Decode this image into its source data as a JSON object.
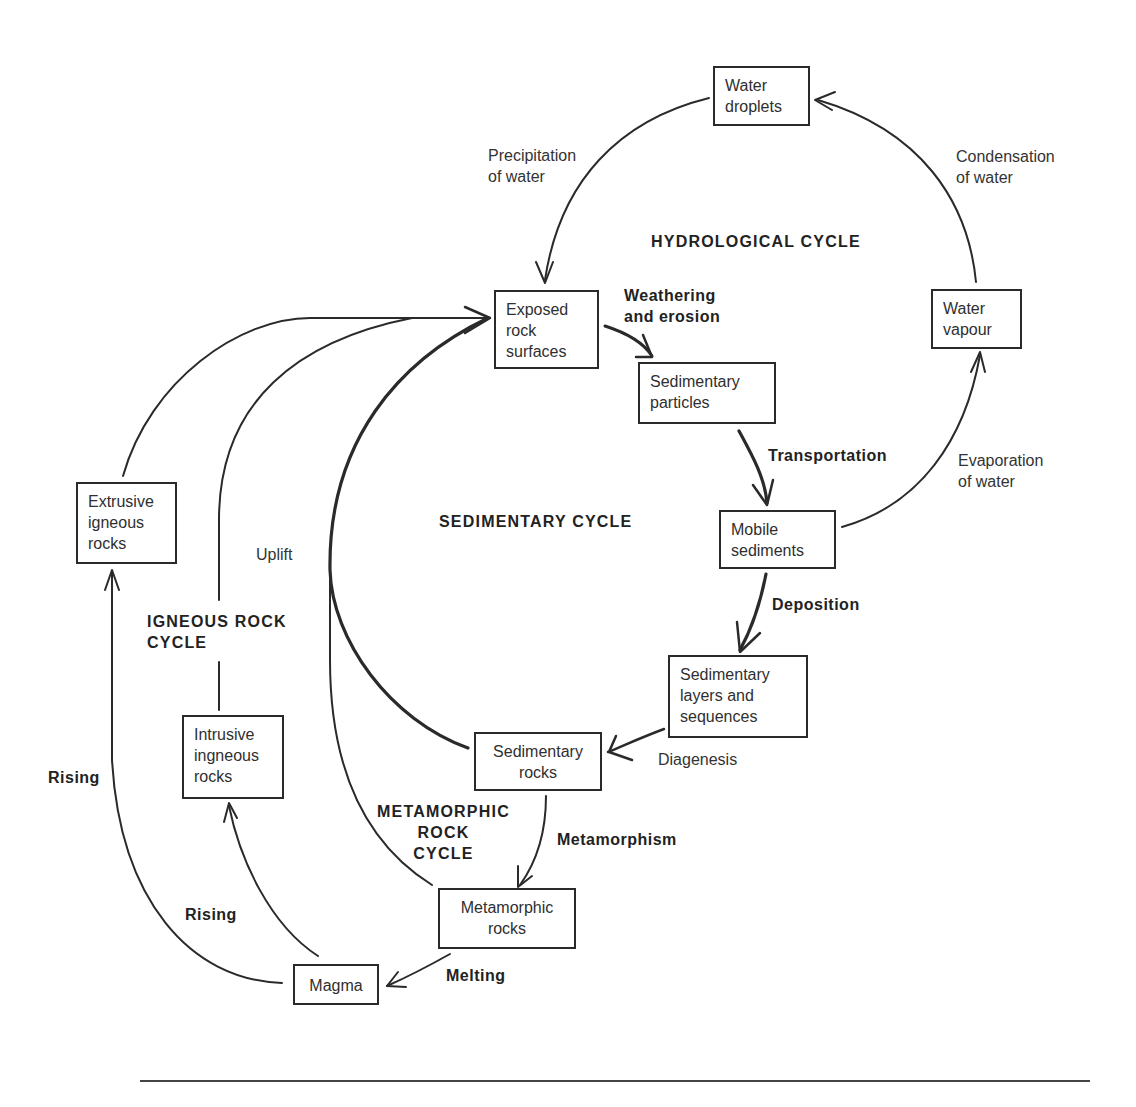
{
  "diagram": {
    "colors": {
      "line": "#2a2a2a",
      "box_border": "#2a2a2a",
      "text": "#2f2f2f"
    },
    "cycles": {
      "hydrological": "HYDROLOGICAL  CYCLE",
      "sedimentary": "SEDIMENTARY  CYCLE",
      "igneous": "IGNEOUS  ROCK\nCYCLE",
      "metamorphic": "METAMORPHIC\nROCK\nCYCLE"
    },
    "nodes": {
      "water_droplets": "Water\ndroplets",
      "water_vapour": "Water\nvapour",
      "exposed_rock": "Exposed\nrock\nsurfaces",
      "sedimentary_particles": "Sedimentary\nparticles",
      "mobile_sediments": "Mobile\nsediments",
      "sedimentary_layers": "Sedimentary\nlayers and\nsequences",
      "sedimentary_rocks": "Sedimentary\nrocks",
      "metamorphic_rocks": "Metamorphic\nrocks",
      "magma": "Magma",
      "extrusive_igneous": "Extrusive\nigneous\nrocks",
      "intrusive_igneous": "Intrusive\ningneous\nrocks"
    },
    "processes": {
      "precipitation": "Precipitation\nof water",
      "condensation": "Condensation\nof water",
      "evaporation": "Evaporation\nof water",
      "weathering": "Weathering\nand erosion",
      "transportation": "Transportation",
      "deposition": "Deposition",
      "diagenesis": "Diagenesis",
      "metamorphism": "Metamorphism",
      "melting": "Melting",
      "rising_outer": "Rising",
      "rising_inner": "Rising",
      "uplift": "Uplift"
    },
    "edges": [
      {
        "from": "water_droplets",
        "to": "exposed_rock",
        "label": "Precipitation of water"
      },
      {
        "from": "water_vapour",
        "to": "water_droplets",
        "label": "Condensation of water"
      },
      {
        "from": "mobile_sediments",
        "to": "water_vapour",
        "label": "Evaporation of water"
      },
      {
        "from": "exposed_rock",
        "to": "sedimentary_particles",
        "label": "Weathering and erosion"
      },
      {
        "from": "sedimentary_particles",
        "to": "mobile_sediments",
        "label": "Transportation"
      },
      {
        "from": "mobile_sediments",
        "to": "sedimentary_layers",
        "label": "Deposition"
      },
      {
        "from": "sedimentary_layers",
        "to": "sedimentary_rocks",
        "label": "Diagenesis"
      },
      {
        "from": "sedimentary_rocks",
        "to": "metamorphic_rocks",
        "label": "Metamorphism"
      },
      {
        "from": "metamorphic_rocks",
        "to": "magma",
        "label": "Melting"
      },
      {
        "from": "magma",
        "to": "extrusive_igneous",
        "label": "Rising"
      },
      {
        "from": "magma",
        "to": "intrusive_igneous",
        "label": "Rising"
      },
      {
        "from": "extrusive_igneous",
        "to": "exposed_rock",
        "label": ""
      },
      {
        "from": "intrusive_igneous",
        "to": "exposed_rock",
        "label": "Uplift"
      },
      {
        "from": "sedimentary_rocks",
        "to": "exposed_rock",
        "label": "Uplift"
      },
      {
        "from": "metamorphic_rocks",
        "to": "exposed_rock",
        "label": "Uplift"
      }
    ]
  }
}
